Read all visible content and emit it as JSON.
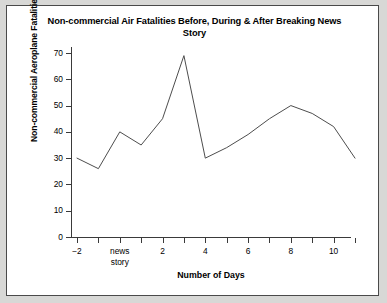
{
  "chart_data": {
    "type": "line",
    "title": "Non-commercial Air Fatalities Before, During & After Breaking News Story",
    "xlabel": "Number of Days",
    "ylabel": "Non-commercial Aeroplane Fatalities",
    "x": [
      -2,
      -1,
      0,
      1,
      2,
      3,
      4,
      5,
      6,
      7,
      8,
      9,
      10,
      11
    ],
    "values": [
      30,
      26,
      40,
      35,
      45,
      69,
      30,
      34,
      39,
      45,
      50,
      47,
      42,
      30
    ],
    "series": [
      {
        "name": "Non-commercial Aeroplane Fatalities",
        "values": [
          30,
          26,
          40,
          35,
          45,
          69,
          30,
          34,
          39,
          45,
          50,
          47,
          42,
          30
        ]
      }
    ],
    "xlim": [
      -2,
      11
    ],
    "ylim": [
      0,
      70
    ],
    "y_ticks": [
      0,
      10,
      20,
      30,
      40,
      50,
      60,
      70
    ],
    "y_tick_labels": [
      "0",
      "10",
      "20",
      "30",
      "40",
      "50",
      "60",
      "70"
    ],
    "x_ticks": [
      -2,
      -1,
      0,
      1,
      2,
      3,
      4,
      5,
      6,
      7,
      8,
      9,
      10,
      11
    ],
    "x_tick_labels": [
      "−2",
      "",
      "news\nstory",
      "",
      "2",
      "",
      "4",
      "",
      "6",
      "",
      "8",
      "",
      "10",
      ""
    ],
    "grid": false,
    "legend": false,
    "line_color": "#4d4d4d",
    "annotations": []
  },
  "figure": {
    "title": "Non-commercial Air Fatalities Before, During & After Breaking News Story",
    "x_axis_title": "Number of Days",
    "y_axis_title": "Non-commercial Aeroplane Fatalities",
    "border_color": "#4a4a4a",
    "background": "#ffffff"
  }
}
